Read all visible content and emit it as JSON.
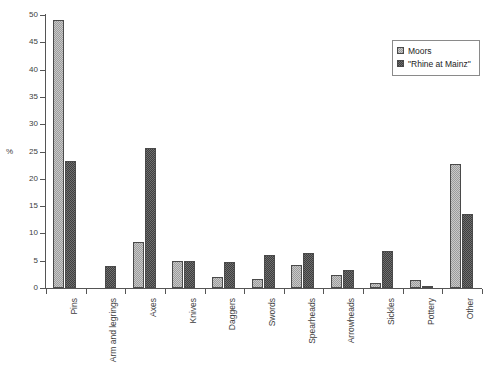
{
  "chart_data": {
    "type": "bar",
    "title": "",
    "subtitle": "",
    "xlabel": "",
    "ylabel": "%",
    "ylim": [
      0,
      50
    ],
    "ytick_step": 5,
    "yticks": [
      0,
      5,
      10,
      15,
      20,
      25,
      30,
      35,
      40,
      45,
      50
    ],
    "ytick_labels": [
      "0",
      "5",
      "10",
      "15",
      "20",
      "25",
      "30",
      "35",
      "40",
      "45",
      "50"
    ],
    "grid": false,
    "legend_position": "top-right",
    "categories": [
      "Pins",
      "Arm and legrings",
      "Axes",
      "Knives",
      "Daggers",
      "Swords",
      "Spearheads",
      "Arrowheads",
      "Sickles",
      "Pottery",
      "Other"
    ],
    "series": [
      {
        "name": "Moors",
        "color": "#9c9c9c",
        "values": [
          49.0,
          0.0,
          8.4,
          4.9,
          2.0,
          1.6,
          4.2,
          2.3,
          0.9,
          1.4,
          22.7
        ]
      },
      {
        "name": "\"Rhine at Mainz\"",
        "color": "#3f3f3f",
        "values": [
          23.2,
          4.1,
          25.6,
          4.9,
          4.7,
          6.0,
          6.4,
          3.3,
          6.8,
          0.1,
          13.5
        ]
      }
    ]
  },
  "legend": {
    "entries": [
      {
        "label": "Moors",
        "swatch": "light-checker-swatch"
      },
      {
        "label": "\"Rhine at Mainz\"",
        "swatch": "dark-checker-swatch"
      }
    ]
  }
}
